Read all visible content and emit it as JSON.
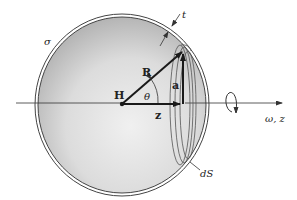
{
  "figure": {
    "colors": {
      "shell_outline": "#444444",
      "sphere_fill_dark": "#b4b4b4",
      "sphere_fill_light": "#efefef",
      "vectors": "#1a1a1a"
    }
  },
  "labels": {
    "sigma": "σ",
    "thickness": "t",
    "radius_vector": "R",
    "center": "H",
    "angle": "θ",
    "ring_radius": "a",
    "axial_distance": "z",
    "axis": "ω, z",
    "surface_element": "dS"
  },
  "icons": {
    "rotation": "rotation-arrow-icon"
  }
}
